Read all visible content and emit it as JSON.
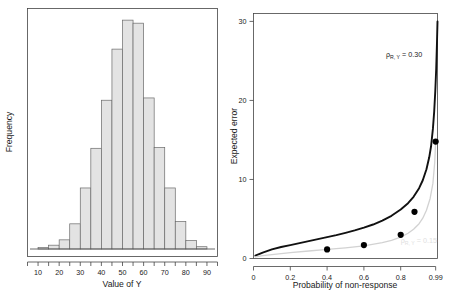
{
  "chart_data": [
    {
      "type": "bar",
      "panel": "left",
      "title": "",
      "xlabel": "Value of Y",
      "ylabel": "Frequency",
      "xlim": [
        5,
        95
      ],
      "ylim": [
        0,
        31
      ],
      "xticks": [
        10,
        20,
        30,
        40,
        50,
        60,
        70,
        80,
        90
      ],
      "xtick_labels": [
        "10",
        "20",
        "30",
        "40",
        "50",
        "60",
        "70",
        "80",
        "90"
      ],
      "minor_xticks": [
        5,
        15,
        25,
        35,
        45,
        55,
        65,
        75,
        85,
        95
      ],
      "yticks": [],
      "ytick_labels": [],
      "grid": false,
      "bin_width": 5,
      "bin_edges": [
        10,
        15,
        20,
        25,
        30,
        35,
        40,
        45,
        50,
        55,
        60,
        65,
        70,
        75,
        80,
        85,
        90
      ],
      "categories": [
        "10-15",
        "15-20",
        "20-25",
        "25-30",
        "30-35",
        "35-40",
        "40-45",
        "45-50",
        "50-55",
        "55-60",
        "60-65",
        "65-70",
        "70-75",
        "75-80",
        "80-85",
        "85-90"
      ],
      "values": [
        0.2,
        0.5,
        1.2,
        3.3,
        8.0,
        13.2,
        19.5,
        26.2,
        30.0,
        29.6,
        19.8,
        13.3,
        8.0,
        3.6,
        1.1,
        0.3
      ],
      "bar_fill": "#e3e3e3",
      "bar_stroke": "#6a6a6a"
    },
    {
      "type": "line",
      "panel": "right",
      "title": "",
      "xlabel": "Probability of non-response",
      "ylabel": "Expected error",
      "xlim": [
        0,
        1.0
      ],
      "ylim": [
        0,
        31
      ],
      "xticks": [
        0,
        0.2,
        0.4,
        0.6,
        0.8,
        0.99
      ],
      "xtick_labels": [
        "0",
        "0.2",
        "0.4",
        "0.6",
        "0.8",
        "0.99"
      ],
      "yticks": [
        0,
        10,
        20,
        30
      ],
      "ytick_labels": [
        "0",
        "10",
        "20",
        "30"
      ],
      "grid": false,
      "legend_position": "inline-annotation",
      "annotations": [
        {
          "text_rho": "ρ",
          "text_sub": "R, Y",
          "text_value": " = 0.30",
          "x": 0.72,
          "y": 25.5,
          "color": "#222222"
        },
        {
          "text_rho": "ρ",
          "text_sub": "R, Y",
          "text_value": " = 0.15",
          "x": 0.8,
          "y": 2.0,
          "color": "#e0e0e0"
        }
      ],
      "series": [
        {
          "name": "ρ R,Y = 0.30",
          "color": "#111111",
          "style": "solid-thick",
          "x": [
            0.01,
            0.05,
            0.1,
            0.15,
            0.2,
            0.25,
            0.3,
            0.35,
            0.4,
            0.45,
            0.5,
            0.55,
            0.6,
            0.65,
            0.7,
            0.75,
            0.8,
            0.84,
            0.87,
            0.9,
            0.92,
            0.94,
            0.955,
            0.965,
            0.975,
            0.982,
            0.988,
            0.993,
            0.997,
            1.0
          ],
          "y": [
            0.35,
            0.75,
            1.15,
            1.45,
            1.7,
            1.95,
            2.2,
            2.45,
            2.7,
            2.95,
            3.25,
            3.55,
            3.9,
            4.3,
            4.8,
            5.4,
            6.2,
            7.0,
            7.8,
            8.9,
            9.9,
            11.3,
            12.8,
            14.2,
            16.4,
            18.6,
            21.2,
            24.0,
            27.2,
            30.0
          ]
        },
        {
          "name": "ρ R,Y = 0.15",
          "color": "#d2d2d2",
          "style": "solid-thin",
          "x": [
            0.01,
            0.05,
            0.1,
            0.2,
            0.3,
            0.4,
            0.5,
            0.6,
            0.7,
            0.75,
            0.8,
            0.84,
            0.87,
            0.9,
            0.92,
            0.94,
            0.96,
            0.975,
            0.985,
            0.99
          ],
          "y": [
            0.2,
            0.35,
            0.5,
            0.75,
            0.95,
            1.15,
            1.35,
            1.6,
            2.0,
            2.3,
            2.7,
            3.2,
            3.7,
            4.4,
            5.1,
            6.1,
            7.6,
            9.5,
            12.2,
            14.8
          ]
        }
      ],
      "points": {
        "name": "simulated estimates",
        "color": "#000000",
        "x": [
          0.4,
          0.6,
          0.8,
          0.875,
          0.99
        ],
        "y": [
          1.15,
          1.7,
          3.0,
          5.9,
          14.8
        ]
      }
    }
  ]
}
